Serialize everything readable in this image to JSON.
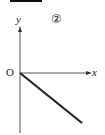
{
  "figure": {
    "number_label": "②",
    "axes": {
      "x_label": "x",
      "y_label": "y",
      "origin_label": "O"
    },
    "line": {
      "description": "straight line through origin with negative slope",
      "start": [
        0,
        0
      ],
      "direction": "down-right"
    }
  },
  "colors": {
    "axis": "#555555",
    "line": "#222222",
    "bar": "#111111"
  }
}
